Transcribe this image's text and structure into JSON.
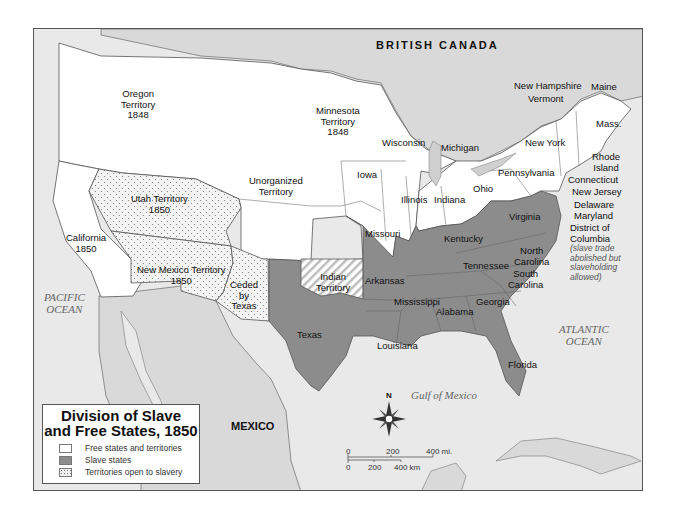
{
  "map": {
    "title_line1": "Division of Slave",
    "title_line2": "and Free States, 1850",
    "colors": {
      "free": "#ffffff",
      "slave": "#8c8c8c",
      "open": "#f0f0f0",
      "foreign_land": "#d9d9d9",
      "water": "#e9e9e9",
      "lakes": "#cfcfcf",
      "border": "#555555"
    },
    "legend": [
      {
        "label": "Free states and territories",
        "category": "free"
      },
      {
        "label": "Slave states",
        "category": "slave"
      },
      {
        "label": "Territories open to slavery",
        "category": "open"
      }
    ],
    "regions": {
      "british_canada": "BRITISH CANADA",
      "mexico": "MEXICO",
      "pacific": [
        "PACIFIC",
        "OCEAN"
      ],
      "atlantic": [
        "ATLANTIC",
        "OCEAN"
      ],
      "gulf": "Gulf of Mexico"
    },
    "labels": {
      "oregon": [
        "Oregon",
        "Territory",
        "1848"
      ],
      "minnesota": [
        "Minnesota",
        "Territory",
        "1848"
      ],
      "unorganized": [
        "Unorganized",
        "Territory"
      ],
      "utah": [
        "Utah Territory",
        "1850"
      ],
      "california": [
        "California",
        "1850"
      ],
      "new_mexico": [
        "New Mexico Territory",
        "1850"
      ],
      "ceded": [
        "Ceded",
        "by",
        "Texas"
      ],
      "indian": [
        "Indian",
        "Territory"
      ],
      "wisconsin": "Wisconsin",
      "michigan": "Michigan",
      "iowa": "Iowa",
      "illinois": "Illinois",
      "indiana": "Indiana",
      "ohio": "Ohio",
      "pennsylvania": "Pennsylvania",
      "new_york": "New York",
      "new_hampshire": "New Hampshire",
      "vermont": "Vermont",
      "maine": "Maine",
      "mass": "Mass.",
      "rhode_island": [
        "Rhode",
        "Island"
      ],
      "connecticut": "Connecticut",
      "new_jersey": "New Jersey",
      "delaware": "Delaware",
      "maryland": "Maryland",
      "dc": [
        "District of",
        "Columbia"
      ],
      "dc_note": [
        "(slave trade",
        "abolished but",
        "slaveholding",
        "allowed)"
      ],
      "missouri": "Missouri",
      "kentucky": "Kentucky",
      "virginia": "Virginia",
      "tennessee": "Tennessee",
      "north_carolina": [
        "North",
        "Carolina"
      ],
      "south_carolina": [
        "South",
        "Carolina"
      ],
      "arkansas": "Arkansas",
      "mississippi": "Mississippi",
      "alabama": "Alabama",
      "georgia": "Georgia",
      "louisiana": "Louisiana",
      "texas": "Texas",
      "florida": "Florida"
    },
    "compass_label": "N",
    "scale": {
      "mi": [
        "0",
        "200",
        "400 mi."
      ],
      "km": [
        "0",
        "200",
        "400 km"
      ]
    }
  }
}
